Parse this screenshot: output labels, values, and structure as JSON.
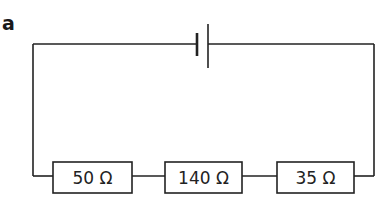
{
  "figure": {
    "part_label": "a",
    "battery": {
      "symbol": "cell",
      "name": "battery"
    },
    "resistors": [
      {
        "label": "50 Ω",
        "value": 50,
        "unit": "Ω"
      },
      {
        "label": "140 Ω",
        "value": 140,
        "unit": "Ω"
      },
      {
        "label": "35 Ω",
        "value": 35,
        "unit": "Ω"
      }
    ],
    "connection": "series",
    "colors": {
      "line": "#222222",
      "background": "#ffffff"
    }
  }
}
